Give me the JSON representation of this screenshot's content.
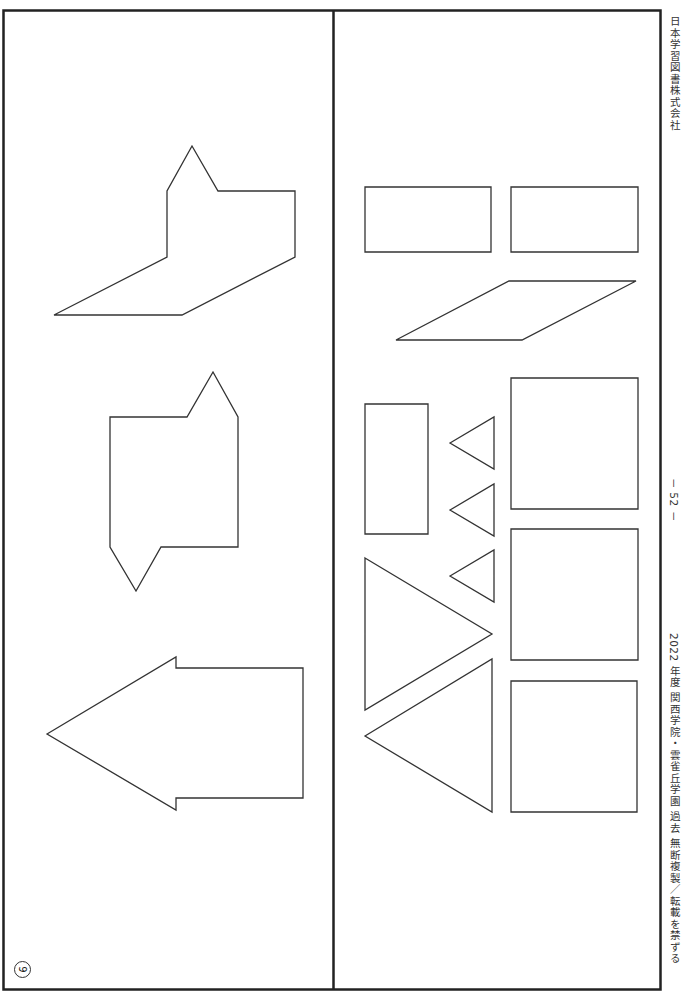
{
  "page": {
    "question_number": "9",
    "page_number": "－ 52 －",
    "publisher": "日本学習図書株式会社",
    "footer": "2022 年度  関西学院・雲雀丘学園  過去   無断複製／転載を禁ずる"
  },
  "colors": {
    "frame": "#222222",
    "shape_stroke": "#333333",
    "background": "#ffffff"
  },
  "left_panel": {
    "label": "target-silhouettes",
    "shapes": [
      {
        "name": "silhouette-pointed-l-shape",
        "points": "192,146 218,191 295,191 295,257 182,315 54,315 167,257 167,191"
      },
      {
        "name": "silhouette-notched-square",
        "points": "110,417 187,417 213,372 238,417 238,547 161,547 136,591 110,547"
      },
      {
        "name": "silhouette-arrow",
        "points": "47,734 176,657 176,668 303,668 303,798 176,798 176,810"
      }
    ]
  },
  "right_panel": {
    "label": "piece-choices",
    "shapes": [
      {
        "name": "piece-rectangle-1",
        "points": "365,187 491,187 491,252 365,252"
      },
      {
        "name": "piece-rectangle-2",
        "points": "511,187 638,187 638,252 511,252"
      },
      {
        "name": "piece-parallelogram",
        "points": "396,340 522,340 636,281 509,281"
      },
      {
        "name": "piece-tall-rectangle",
        "points": "365,404 428,404 428,534 365,534"
      },
      {
        "name": "piece-small-triangle-1",
        "points": "450,443 494,417 494,469"
      },
      {
        "name": "piece-small-triangle-2",
        "points": "450,510 494,484 494,536"
      },
      {
        "name": "piece-small-triangle-3",
        "points": "450,576 494,550 494,602"
      },
      {
        "name": "piece-square-1",
        "points": "511,378 638,378 638,509 511,509"
      },
      {
        "name": "piece-square-2",
        "points": "511,529 638,529 638,660 511,660"
      },
      {
        "name": "piece-square-3",
        "points": "511,681 637,681 637,812 511,812"
      },
      {
        "name": "piece-large-triangle-1",
        "points": "365,558 492,634 365,710"
      },
      {
        "name": "piece-large-triangle-2",
        "points": "365,736 492,659 492,812"
      }
    ]
  }
}
